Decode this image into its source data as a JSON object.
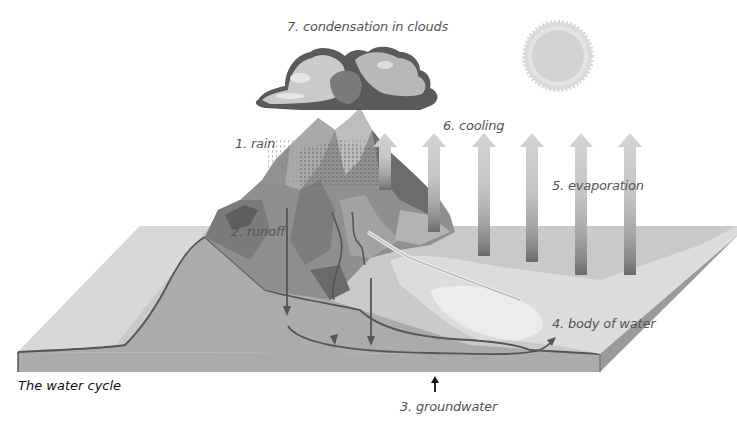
{
  "diagram": {
    "caption": "The water cycle",
    "labels": {
      "rain": "1. rain",
      "runoff": "2. runoff",
      "groundwater": "3. groundwater",
      "body_of_water": "4. body of water",
      "evaporation": "5. evaporation",
      "cooling": "6. cooling",
      "condensation": "7. condensation in clouds"
    },
    "elements": [
      "cloud",
      "sun",
      "rain",
      "mountain",
      "river",
      "evaporation-arrows",
      "groundwater-flow",
      "land-slab"
    ],
    "colors": {
      "slab_top": "#c8c8c8",
      "slab_left_top": "#d6d6d6",
      "slab_front": "#a6a6a6",
      "ground_section": "#ababab",
      "mountain_dark": "#6e6e6e",
      "mountain_mid": "#8f8f8f",
      "mountain_light": "#bdbdbd",
      "arrow_light": "#d2d2d2",
      "arrow_dark": "#6a6a6a",
      "flow_line": "#555555",
      "sun": "#d4d4d4",
      "text": "#555555"
    }
  }
}
